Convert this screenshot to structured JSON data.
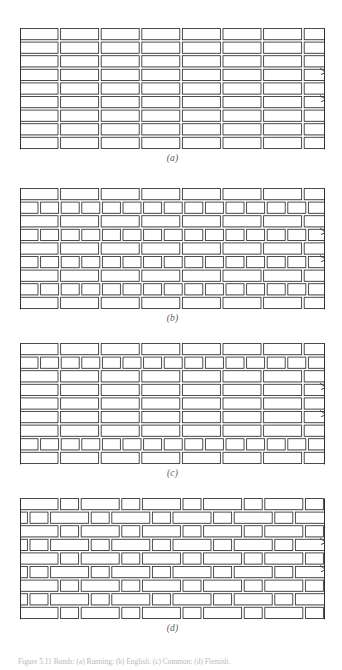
{
  "figure": {
    "caption": "Figure 5.11  Bonds: (a) Running; (b) English; (c) Common; (d) Flemish.",
    "panels": [
      {
        "id": "a",
        "label": "(a)",
        "bond_name": "Running bond",
        "description": "All courses are stretchers; each course offset one-half brick from the course below.",
        "courses": 9,
        "course_types": [
          "stretcher",
          "stretcher",
          "stretcher",
          "stretcher",
          "stretcher",
          "stretcher",
          "stretcher",
          "stretcher",
          "stretcher"
        ],
        "offsets": [
          0,
          0.5,
          0,
          0.5,
          0,
          0.5,
          0,
          0.5,
          0
        ]
      },
      {
        "id": "b",
        "label": "(b)",
        "bond_name": "English bond",
        "description": "Alternating courses of stretchers and headers.",
        "courses": 9,
        "course_types": [
          "stretcher",
          "header",
          "stretcher",
          "header",
          "stretcher",
          "header",
          "stretcher",
          "header",
          "stretcher"
        ],
        "offsets": [
          0,
          0.25,
          0,
          0.25,
          0,
          0.25,
          0,
          0.25,
          0
        ]
      },
      {
        "id": "c",
        "label": "(c)",
        "bond_name": "Common bond",
        "description": "Courses of stretchers with a full header course at regular intervals.",
        "courses": 9,
        "course_types": [
          "stretcher",
          "header",
          "stretcher",
          "stretcher",
          "stretcher",
          "stretcher",
          "stretcher",
          "header",
          "stretcher"
        ],
        "offsets": [
          0,
          0.25,
          0,
          0.5,
          0,
          0.5,
          0,
          0.25,
          0
        ]
      },
      {
        "id": "d",
        "label": "(d)",
        "bond_name": "Flemish bond",
        "description": "Headers and stretchers alternate within every course.",
        "courses": 9,
        "course_types": [
          "flemish",
          "flemish",
          "flemish",
          "flemish",
          "flemish",
          "flemish",
          "flemish",
          "flemish",
          "flemish"
        ],
        "offsets": [
          0,
          0.5,
          0,
          0.5,
          0,
          0.5,
          0,
          0.5,
          0
        ]
      }
    ],
    "colors": {
      "brick_outline": "#3a3a3a",
      "brick_fill": "#ffffff",
      "mortar_shadow": "#9a9a9a",
      "border_line": "#2f2f2f",
      "label_text": "#5a5a5a",
      "caption_text": "#b9b9b9",
      "background": "#ffffff"
    },
    "break_marks": {
      "name": "break-mark",
      "count_per_panel": 2,
      "side": "right"
    }
  }
}
